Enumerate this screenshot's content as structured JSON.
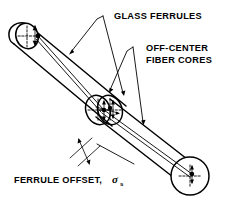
{
  "figure": {
    "background_color": "#ffffff",
    "line_color": "#000000",
    "labels": {
      "glass_ferrules": "GLASS FERRULES",
      "off_center_line1": "OFF-CENTER",
      "off_center_line2": "FIBER CORES",
      "ferrule_offset": "FERRULE OFFSET,",
      "offset_symbol": "σ",
      "offset_subscript": "s"
    },
    "annotations": [
      {
        "name": "glass-ferrules",
        "text": "GLASS FERRULES",
        "leader_count": 2,
        "points_to": [
          "upper-left-ferrule-body",
          "lower-right-ferrule-body"
        ]
      },
      {
        "name": "off-center-fiber-cores",
        "text": "OFF-CENTER FIBER CORES",
        "leader_count": 2,
        "points_to": [
          "upper-fiber-core",
          "lower-fiber-core"
        ]
      },
      {
        "name": "ferrule-offset",
        "text": "FERRULE OFFSET, σs",
        "leader_count": 1,
        "points_to": [
          "offset-dimension-arrow"
        ]
      }
    ],
    "components": [
      {
        "name": "upper-left-ferrule",
        "type": "cylinder",
        "end_face": "ellipse-with-crosshair",
        "core": "off-center"
      },
      {
        "name": "lower-right-ferrule",
        "type": "cylinder",
        "end_face": "circle-with-crosshair",
        "core": "off-center"
      },
      {
        "name": "splice-junction",
        "type": "mating-end-faces",
        "feature": "offset-between-cores"
      }
    ]
  }
}
